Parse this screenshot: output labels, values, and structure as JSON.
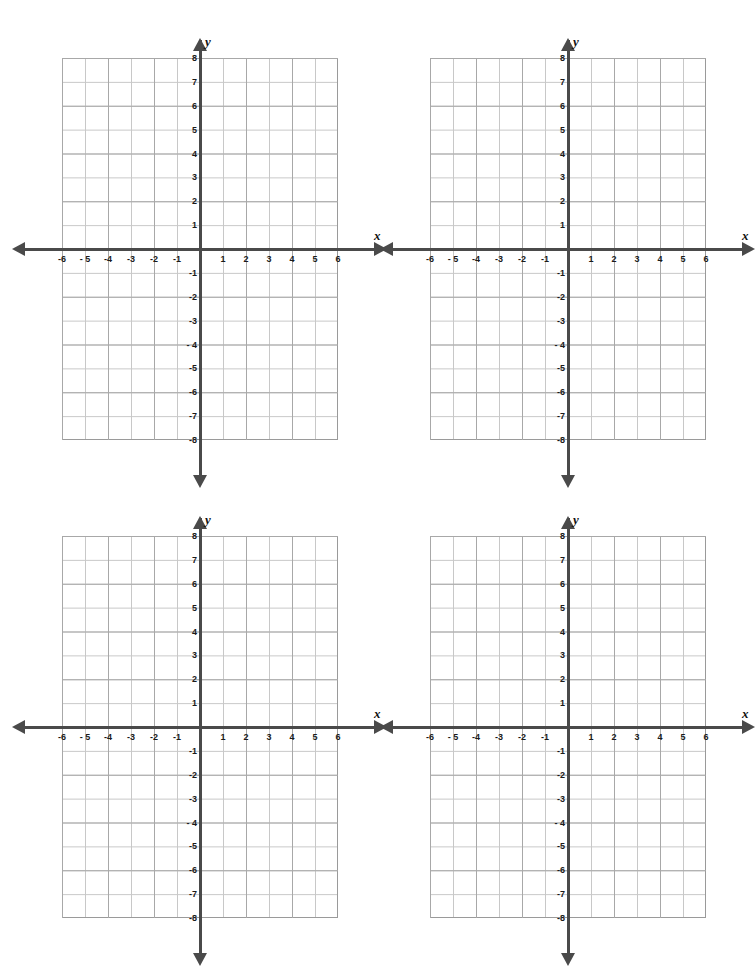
{
  "page": {
    "background_color": "#ffffff",
    "width": 725,
    "height": 918,
    "layout": "2x2 grid of identical blank Cartesian coordinate planes; bottom row clipped by page edge"
  },
  "style": {
    "axis_color": "#4a4a4a",
    "grid_line_color": "#c8c8c8",
    "grid_major_color": "#a8a8a8",
    "plot_border_color": "#9a9a9a",
    "label_color": "#1a1a1a"
  },
  "chart_data": {
    "type": "scatter",
    "title": "",
    "subtitle": "",
    "xlabel": "x",
    "ylabel": "y",
    "xlim": [
      -6,
      6
    ],
    "ylim": [
      -8,
      8
    ],
    "xticks": [
      -6,
      -5,
      -4,
      -3,
      -2,
      -1,
      1,
      2,
      3,
      4,
      5,
      6
    ],
    "yticks": [
      8,
      7,
      6,
      5,
      4,
      3,
      2,
      1,
      -1,
      -2,
      -3,
      -4,
      -5,
      -6,
      -7,
      -8
    ],
    "xtick_labels": [
      "-6",
      "- 5",
      "-4",
      "-3",
      "-2",
      "-1",
      "1",
      "2",
      "3",
      "4",
      "5",
      "6"
    ],
    "ytick_labels": [
      "8",
      "7",
      "6",
      "5",
      "4",
      "3",
      "2",
      "1",
      "-1",
      "-2",
      "-3",
      "- 4",
      "-5",
      "-6",
      "-7",
      "-8"
    ],
    "grid": true,
    "legend": "none",
    "series": [],
    "annotations": [],
    "panels": 4,
    "note": "Four empty coordinate planes, no plotted data points"
  },
  "graphs": [
    {
      "id": "graph-1",
      "position": "top-left",
      "axis_label_x": "x",
      "axis_label_y": "y",
      "xtick_labels": [
        "-6",
        "- 5",
        "-4",
        "-3",
        "-2",
        "-1",
        "1",
        "2",
        "3",
        "4",
        "5",
        "6"
      ],
      "ytick_labels": [
        "8",
        "7",
        "6",
        "5",
        "4",
        "3",
        "2",
        "1",
        "-1",
        "-2",
        "-3",
        "- 4",
        "-5",
        "-6",
        "-7",
        "-8"
      ]
    },
    {
      "id": "graph-2",
      "position": "top-right",
      "axis_label_x": "x",
      "axis_label_y": "y",
      "xtick_labels": [
        "-6",
        "- 5",
        "-4",
        "-3",
        "-2",
        "-1",
        "1",
        "2",
        "3",
        "4",
        "5",
        "6"
      ],
      "ytick_labels": [
        "8",
        "7",
        "6",
        "5",
        "4",
        "3",
        "2",
        "1",
        "-1",
        "-2",
        "-3",
        "- 4",
        "-5",
        "-6",
        "-7",
        "-8"
      ]
    },
    {
      "id": "graph-3",
      "position": "bottom-left",
      "axis_label_x": "x",
      "axis_label_y": "y",
      "xtick_labels": [
        "-6",
        "- 5",
        "-4",
        "-3",
        "-2",
        "-1",
        "1",
        "2",
        "3",
        "4",
        "5",
        "6"
      ],
      "ytick_labels": [
        "8",
        "7",
        "6",
        "5",
        "4",
        "3",
        "2",
        "1",
        "-1",
        "-2",
        "-3",
        "- 4",
        "-5",
        "-6",
        "-7",
        "-8"
      ]
    },
    {
      "id": "graph-4",
      "position": "bottom-right",
      "axis_label_x": "x",
      "axis_label_y": "y",
      "xtick_labels": [
        "-6",
        "- 5",
        "-4",
        "-3",
        "-2",
        "-1",
        "1",
        "2",
        "3",
        "4",
        "5",
        "6"
      ],
      "ytick_labels": [
        "8",
        "7",
        "6",
        "5",
        "4",
        "3",
        "2",
        "1",
        "-1",
        "-2",
        "-3",
        "- 4",
        "-5",
        "-6",
        "-7",
        "-8"
      ]
    }
  ]
}
